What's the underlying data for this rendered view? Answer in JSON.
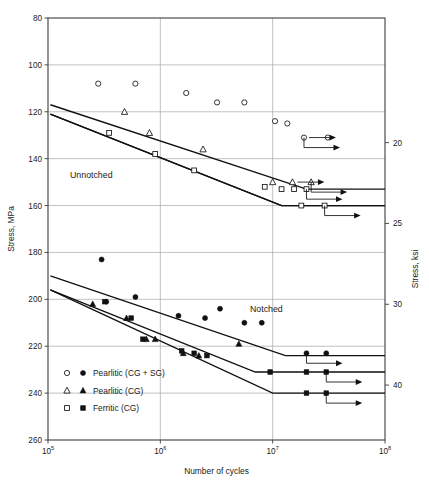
{
  "figure": {
    "title": "",
    "width": 429,
    "height": 488
  },
  "axes": {
    "x_title": "Number of cycles",
    "y_left_title": "Stress, MPa",
    "y_right_title": "Stress, ksi",
    "x_tick_labels": [
      "10",
      "10",
      "10",
      "10"
    ],
    "x_tick_exponents": [
      "5",
      "6",
      "7",
      "8"
    ],
    "y_left_ticks": [
      "260",
      "240",
      "220",
      "200",
      "180",
      "160",
      "140",
      "120",
      "100",
      "80"
    ],
    "y_right_ticks": [
      "40",
      "30",
      "25",
      "20",
      "15"
    ]
  },
  "annotations": {
    "unnotched": "Unnotched",
    "notched": "Notched"
  },
  "legend": {
    "items": [
      {
        "label": "Pearlitic (CG + SG)",
        "open_marker": "circle",
        "filled_marker": "circle"
      },
      {
        "label": "Pearlitic (CG)",
        "open_marker": "triangle",
        "filled_marker": "triangle"
      },
      {
        "label": "Ferritic (CG)",
        "open_marker": "square",
        "filled_marker": "square"
      }
    ]
  },
  "chart_data": {
    "type": "scatter",
    "title": "",
    "xlabel": "Number of cycles",
    "ylabel": "Stress, MPa",
    "ylabel_right": "Stress, ksi",
    "xscale": "log",
    "xlim": [
      100000,
      100000000
    ],
    "ylim": [
      80,
      260
    ],
    "ylim_right": [
      11.6,
      37.7
    ],
    "grid": true,
    "legend_position": "lower-left",
    "xticks": [
      100000,
      1000000,
      10000000,
      100000000
    ],
    "yticks_left": [
      80,
      100,
      120,
      140,
      160,
      180,
      200,
      220,
      240,
      260
    ],
    "yticks_right": [
      15,
      20,
      25,
      30,
      40
    ],
    "groups": [
      {
        "name": "Unnotched",
        "series": [
          {
            "name": "Pearlitic (CG + SG)",
            "marker": "open-circle",
            "points": [
              [
                280000,
                232
              ],
              [
                600000,
                232
              ],
              [
                1700000,
                228
              ],
              [
                3200000,
                224
              ],
              [
                5600000,
                224
              ],
              [
                10500000,
                216
              ],
              [
                13500000,
                215
              ],
              [
                19000000,
                209
              ],
              [
                31000000,
                209
              ]
            ],
            "fit_line": [
              [
                105000,
                223
              ],
              [
                20000000,
                187
              ],
              [
                100000000,
                187
              ]
            ],
            "runout": [
              [
                19000000,
                209
              ]
            ]
          },
          {
            "name": "Pearlitic (CG)",
            "marker": "open-triangle",
            "points": [
              [
                480000,
                220
              ],
              [
                800000,
                211
              ],
              [
                2400000,
                204
              ],
              [
                10000000,
                190
              ],
              [
                15000000,
                190
              ],
              [
                22000000,
                190
              ]
            ],
            "fit_line": [
              [
                105000,
                219
              ],
              [
                12000000,
                180
              ],
              [
                100000000,
                180
              ]
            ],
            "runout": [
              [
                22000000,
                190
              ]
            ]
          },
          {
            "name": "Ferritic (CG)",
            "marker": "open-square",
            "points": [
              [
                350000,
                211
              ],
              [
                900000,
                202
              ],
              [
                2000000,
                195
              ],
              [
                8500000,
                188
              ],
              [
                12000000,
                187
              ],
              [
                15500000,
                187
              ],
              [
                20000000,
                187
              ],
              [
                18000000,
                180
              ],
              [
                29000000,
                180
              ]
            ],
            "fit_line": [
              [
                105000,
                219
              ],
              [
                12000000,
                180
              ],
              [
                100000000,
                180
              ]
            ],
            "runout": [
              [
                20000000,
                187
              ],
              [
                29000000,
                180
              ]
            ]
          }
        ]
      },
      {
        "name": "Notched",
        "series": [
          {
            "name": "Pearlitic (CG + SG)",
            "marker": "filled-circle",
            "points": [
              [
                300000,
                157
              ],
              [
                330000,
                139
              ],
              [
                600000,
                141
              ],
              [
                1450000,
                133
              ],
              [
                2500000,
                132
              ],
              [
                3400000,
                136
              ],
              [
                5600000,
                130
              ],
              [
                8000000,
                130
              ],
              [
                20000000,
                117
              ],
              [
                30000000,
                117
              ]
            ],
            "fit_line": [
              [
                105000,
                150
              ],
              [
                13000000,
                116
              ],
              [
                100000000,
                116
              ]
            ],
            "runout": [
              [
                20000000,
                117
              ]
            ]
          },
          {
            "name": "Pearlitic (CG)",
            "marker": "filled-triangle",
            "points": [
              [
                250000,
                138
              ],
              [
                500000,
                132
              ],
              [
                750000,
                123
              ],
              [
                900000,
                123
              ],
              [
                1600000,
                117
              ],
              [
                2200000,
                116
              ],
              [
                5000000,
                121
              ]
            ],
            "fit_line": [
              [
                105000,
                144
              ],
              [
                10000000,
                100
              ],
              [
                100000000,
                100
              ]
            ],
            "runout": []
          },
          {
            "name": "Ferritic (CG)",
            "marker": "filled-square",
            "points": [
              [
                320000,
                139
              ],
              [
                550000,
                132
              ],
              [
                700000,
                123
              ],
              [
                1550000,
                118
              ],
              [
                2000000,
                117
              ],
              [
                2600000,
                116
              ],
              [
                9500000,
                109
              ],
              [
                20000000,
                109
              ],
              [
                30000000,
                109
              ],
              [
                20000000,
                100
              ],
              [
                30000000,
                100
              ]
            ],
            "fit_line": [
              [
                105000,
                144
              ],
              [
                7000000,
                109
              ],
              [
                100000000,
                109
              ]
            ],
            "runout": [
              [
                30000000,
                109
              ],
              [
                30000000,
                100
              ]
            ]
          }
        ]
      }
    ]
  }
}
